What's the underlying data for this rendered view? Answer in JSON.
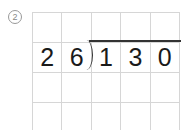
{
  "problem": {
    "number": "2",
    "divisor": [
      "2",
      "6"
    ],
    "dividend": [
      "1",
      "3",
      "0"
    ]
  }
}
